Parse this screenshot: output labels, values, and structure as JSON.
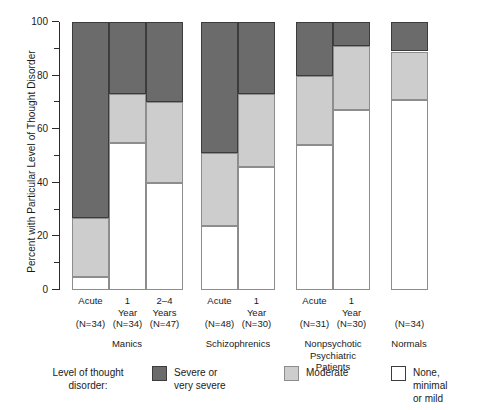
{
  "chart_data": {
    "type": "bar",
    "title": "",
    "subtitle": "",
    "stacked": true,
    "orientation": "vertical",
    "xlabel": "",
    "ylabel": "Percent with Particular Level of Thought Disorder",
    "ylim": [
      0,
      100
    ],
    "yticks": [
      0,
      20,
      40,
      60,
      80,
      100
    ],
    "ytick_labels": [
      "0",
      "20",
      "40",
      "60",
      "80",
      "100"
    ],
    "yminor_ticks": [
      10,
      30,
      50,
      70,
      90
    ],
    "grid": false,
    "legend_position": "bottom",
    "legend_title": "Level of thought\ndisorder:",
    "series": [
      {
        "name": "Severe or\nvery severe",
        "color": "#6b6b6b",
        "values": [
          73,
          27,
          30,
          49,
          27,
          20,
          9,
          11
        ]
      },
      {
        "name": "Moderate",
        "color": "#cdcdcd",
        "values": [
          22,
          18,
          30,
          27,
          27,
          26,
          24,
          18
        ]
      },
      {
        "name": "None, minimal\nor mild",
        "color": "#ffffff",
        "values": [
          5,
          55,
          40,
          24,
          46,
          54,
          67,
          71
        ]
      }
    ],
    "categories": [
      "Acute\n(N=34)",
      "1\nYear\n(N=34)",
      "2–4\nYears\n(N=47)",
      "Acute\n(N=48)",
      "1\nYear\n(N=30)",
      "Acute\n(N=31)",
      "1\nYear\n(N=30)",
      "(N=34)"
    ],
    "cumulative_tops": {
      "none_top": [
        5,
        55,
        40,
        24,
        46,
        54,
        67,
        71
      ],
      "moderate_top": [
        27,
        73,
        70,
        51,
        73,
        80,
        91,
        89
      ],
      "severe_top": [
        100,
        100,
        100,
        100,
        100,
        100,
        100,
        100
      ]
    },
    "groups": [
      {
        "label": "Manics",
        "bars": [
          0,
          1,
          2
        ]
      },
      {
        "label": "Schizophrenics",
        "bars": [
          3,
          4
        ]
      },
      {
        "label": "Nonpsychotic\nPsychiatric\nPatients",
        "bars": [
          5,
          6
        ]
      },
      {
        "label": "Normals",
        "bars": [
          7
        ]
      }
    ]
  },
  "axis": {
    "y_title": "Percent with Particular Level of Thought Disorder",
    "ticks": [
      {
        "value": 100,
        "label": "100"
      },
      {
        "value": 90,
        "label": ""
      },
      {
        "value": 80,
        "label": "80"
      },
      {
        "value": 70,
        "label": ""
      },
      {
        "value": 60,
        "label": "60"
      },
      {
        "value": 50,
        "label": ""
      },
      {
        "value": 40,
        "label": "40"
      },
      {
        "value": 30,
        "label": ""
      },
      {
        "value": 20,
        "label": "20"
      },
      {
        "value": 10,
        "label": ""
      },
      {
        "value": 0,
        "label": "0"
      }
    ]
  },
  "bars": [
    {
      "id": "manics-acute",
      "time_label": "Acute",
      "n_label": "(N=34)",
      "none": 5,
      "moderate": 22,
      "severe": 73
    },
    {
      "id": "manics-1year",
      "time_label": "1\nYear",
      "n_label": "(N=34)",
      "none": 55,
      "moderate": 18,
      "severe": 27
    },
    {
      "id": "manics-2to4years",
      "time_label": "2–4\nYears",
      "n_label": "(N=47)",
      "none": 40,
      "moderate": 30,
      "severe": 30
    },
    {
      "id": "schizo-acute",
      "time_label": "Acute",
      "n_label": "(N=48)",
      "none": 24,
      "moderate": 27,
      "severe": 49
    },
    {
      "id": "schizo-1year",
      "time_label": "1\nYear",
      "n_label": "(N=30)",
      "none": 46,
      "moderate": 27,
      "severe": 27
    },
    {
      "id": "nonpsych-acute",
      "time_label": "Acute",
      "n_label": "(N=31)",
      "none": 54,
      "moderate": 26,
      "severe": 20
    },
    {
      "id": "nonpsych-1year",
      "time_label": "1\nYear",
      "n_label": "(N=30)",
      "none": 67,
      "moderate": 24,
      "severe": 9
    },
    {
      "id": "normals",
      "time_label": "",
      "n_label": "(N=34)",
      "none": 71,
      "moderate": 18,
      "severe": 11
    }
  ],
  "group_labels": [
    {
      "id": "manics",
      "text": "Manics"
    },
    {
      "id": "schizophrenics",
      "text": "Schizophrenics"
    },
    {
      "id": "nonpsychotic",
      "text": "Nonpsychotic\nPsychiatric\nPatients"
    },
    {
      "id": "normals",
      "text": "Normals"
    }
  ],
  "legend": {
    "title": "Level of thought\ndisorder:",
    "items": [
      {
        "key": "severe",
        "label": "Severe or\nvery severe",
        "color": "#6b6b6b"
      },
      {
        "key": "moderate",
        "label": "Moderate",
        "color": "#cdcdcd"
      },
      {
        "key": "none",
        "label": "None, minimal\nor mild",
        "color": "#ffffff"
      }
    ]
  }
}
